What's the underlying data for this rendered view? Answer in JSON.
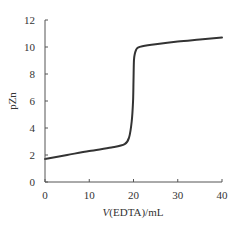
{
  "chart_data": {
    "type": "line",
    "title": "",
    "xlabel": "V(EDTA)/mL",
    "xlabel_italic_part": "V",
    "xlabel_rest": "(EDTA)/mL",
    "ylabel": "pZn",
    "xlim": [
      0,
      40
    ],
    "ylim": [
      0,
      12
    ],
    "xticks": [
      0,
      10,
      20,
      30,
      40
    ],
    "yticks": [
      0,
      2,
      4,
      6,
      8,
      10,
      12
    ],
    "grid": false,
    "legend": null,
    "series": [
      {
        "name": "pZn titration curve",
        "color": "#333333",
        "x": [
          0,
          5,
          10,
          15,
          18,
          19,
          19.6,
          19.9,
          20.0,
          20.1,
          20.3,
          20.6,
          21,
          22,
          25,
          30,
          35,
          40
        ],
        "y": [
          1.7,
          2.0,
          2.3,
          2.55,
          2.8,
          3.3,
          4.5,
          6.0,
          7.5,
          9.0,
          9.5,
          9.8,
          9.95,
          10.05,
          10.2,
          10.4,
          10.55,
          10.7
        ]
      }
    ]
  }
}
